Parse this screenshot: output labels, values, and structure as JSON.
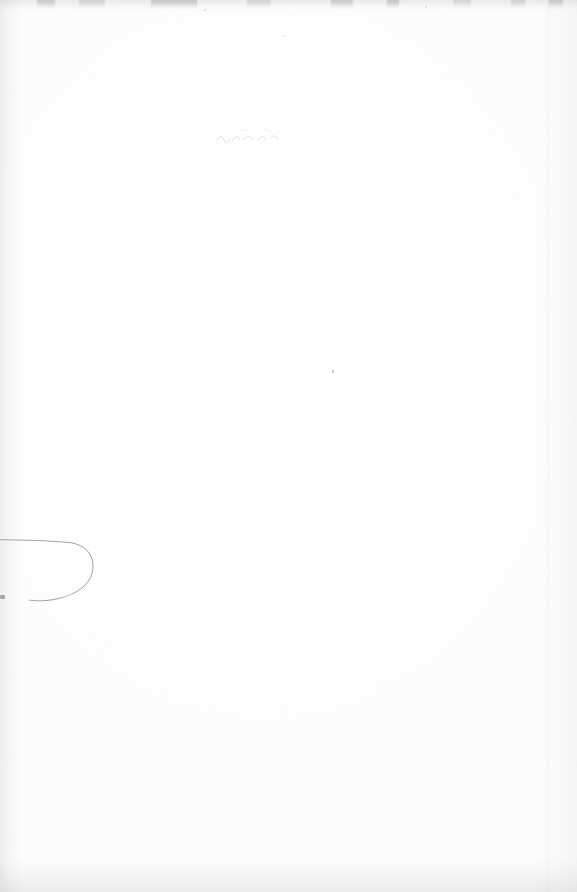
{
  "page": {
    "kind": "scanned-blank-page",
    "width": 577,
    "height": 892,
    "visible_text": "",
    "background_color": "#fdfdfd",
    "paper_tone": "#fefefe"
  },
  "artifacts": {
    "ink_stroke": {
      "name": "hook-stroke",
      "color": "#a8a4a6",
      "stroke_width": 1,
      "description": "Faint hook-shaped pen stroke entering from the left edge, looping right and returning down-left",
      "path": "M -6 540 L 46 541 L 72 543 C 86 546 93 555 93 566 C 93 579 84 589 70 595 C 56 600 44 601 31 600",
      "bounds": {
        "x": 0,
        "y": 538,
        "width": 95,
        "height": 64
      }
    },
    "edges": {
      "left_shadow_color": "#7d7d82",
      "right_shadow_color": "#82828a",
      "top_band_color": "#7a7a80",
      "bottom_band_color": "#78787e",
      "right_crease_x": 547
    },
    "specks": [
      {
        "name": "speck-center",
        "x": 332,
        "y": 370,
        "color": "#787880"
      },
      {
        "name": "speck-left-edge",
        "x": 0,
        "y": 595,
        "color": "#696970"
      },
      {
        "name": "speck-a",
        "x": 204,
        "y": 9,
        "color": "#82828a"
      },
      {
        "name": "speck-b",
        "x": 425,
        "y": 6,
        "color": "#82828a"
      },
      {
        "name": "speck-c",
        "x": 283,
        "y": 35,
        "color": "#8c8c94"
      }
    ],
    "ghost_bleed": {
      "name": "ghost-marks",
      "x": 214,
      "y": 128,
      "width": 72,
      "height": 18,
      "legible": false,
      "note": "Illegible show-through from the reverse side"
    }
  }
}
